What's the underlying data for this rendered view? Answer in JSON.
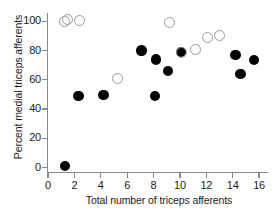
{
  "chart_data": {
    "type": "scatter",
    "title": "",
    "xlabel": "Total number of triceps afferents",
    "ylabel": "Percent medial triceps afferents",
    "xlim": [
      0,
      16.6
    ],
    "ylim": [
      -3,
      105
    ],
    "grid": false,
    "legend": "none",
    "xticks": [
      0,
      2,
      4,
      6,
      8,
      10,
      12,
      14,
      16
    ],
    "xtick_labels": [
      "0",
      "2",
      "4",
      "6",
      "8",
      "10",
      "12",
      "14",
      "16"
    ],
    "yticks": [
      0,
      20,
      40,
      60,
      80,
      100
    ],
    "ytick_labels": [
      "0",
      "20",
      "40",
      "60",
      "80",
      "100"
    ],
    "series": [
      {
        "name": "filled",
        "marker": "filled-circle",
        "color": "#000000",
        "points": [
          {
            "x": 1.3,
            "y": 1
          },
          {
            "x": 2.3,
            "y": 49
          },
          {
            "x": 4.2,
            "y": 49.5
          },
          {
            "x": 7.1,
            "y": 80
          },
          {
            "x": 8.1,
            "y": 49
          },
          {
            "x": 8.2,
            "y": 74
          },
          {
            "x": 9.1,
            "y": 66
          },
          {
            "x": 10.1,
            "y": 79
          },
          {
            "x": 14.2,
            "y": 77
          },
          {
            "x": 14.6,
            "y": 64
          },
          {
            "x": 15.6,
            "y": 73.5
          }
        ]
      },
      {
        "name": "open",
        "marker": "open-circle",
        "color": "#9a9a9a",
        "points": [
          {
            "x": 1.25,
            "y": 100
          },
          {
            "x": 1.45,
            "y": 101.5
          },
          {
            "x": 2.4,
            "y": 100.5
          },
          {
            "x": 5.3,
            "y": 61
          },
          {
            "x": 9.2,
            "y": 99.5
          },
          {
            "x": 10.1,
            "y": 79
          },
          {
            "x": 11.2,
            "y": 81
          },
          {
            "x": 12.1,
            "y": 89
          },
          {
            "x": 13.0,
            "y": 90.5
          }
        ]
      }
    ]
  }
}
